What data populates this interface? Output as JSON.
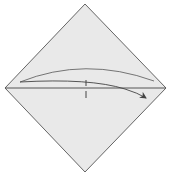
{
  "diagram": {
    "type": "origami-fold-step",
    "paper": {
      "shape": "square-diamond",
      "fill": "#e9e9e9",
      "stroke": "#555555",
      "vertices": {
        "top": [
          85,
          4
        ],
        "right": [
          166,
          88
        ],
        "bottom": [
          85,
          172
        ],
        "left": [
          5,
          88
        ]
      }
    },
    "crease": {
      "label": "horizontal-diagonal-crease",
      "from": [
        5,
        88
      ],
      "to": [
        166,
        88
      ],
      "color": "#555555"
    },
    "center_mark": {
      "label": "center-tick",
      "x": 86,
      "y1": 80,
      "y2": 99,
      "color": "#555555"
    },
    "fold_arrow": {
      "label": "fold-arrow",
      "direction": "left-to-right",
      "color": "#555555"
    },
    "upper_arc": {
      "label": "upper-fold-arc",
      "color": "#666666"
    }
  }
}
